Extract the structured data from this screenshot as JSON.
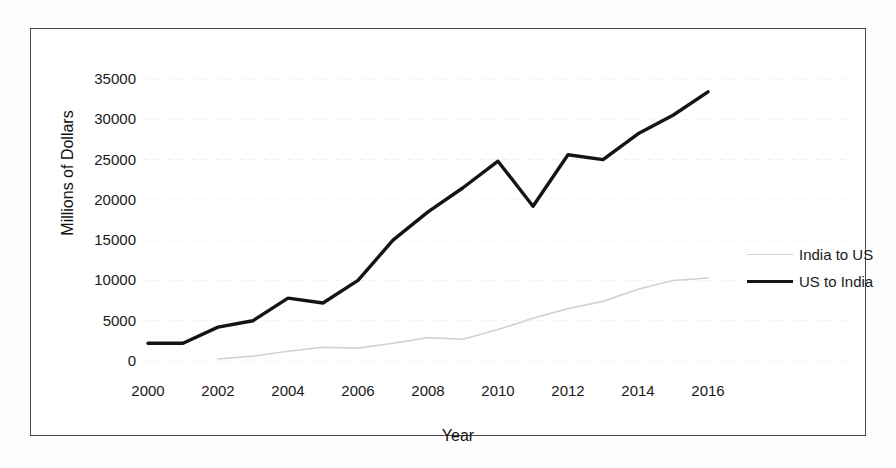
{
  "chart_data": {
    "type": "line",
    "title": "",
    "xlabel": "Year",
    "ylabel": "Millions of Dollars",
    "x": [
      2000,
      2001,
      2002,
      2003,
      2004,
      2005,
      2006,
      2007,
      2008,
      2009,
      2010,
      2011,
      2012,
      2013,
      2014,
      2015,
      2016
    ],
    "xticks": [
      "2000",
      "2002",
      "2004",
      "2006",
      "2008",
      "2010",
      "2012",
      "2014",
      "2016"
    ],
    "yticks": [
      "0",
      "5000",
      "10000",
      "15000",
      "20000",
      "25000",
      "30000",
      "35000"
    ],
    "xlim": [
      2000,
      2016
    ],
    "ylim": [
      0,
      35000
    ],
    "grid": false,
    "legend_position": "right",
    "series": [
      {
        "name": "India to US",
        "color": "#d2d2d2",
        "x": [
          2002,
          2003,
          2004,
          2005,
          2006,
          2007,
          2008,
          2009,
          2010,
          2011,
          2012,
          2013,
          2014,
          2015,
          2016
        ],
        "values": [
          250,
          600,
          1200,
          1700,
          1600,
          2200,
          2900,
          2700,
          3900,
          5300,
          6500,
          7400,
          8900,
          10000,
          10300
        ]
      },
      {
        "name": "US to India",
        "color": "#141414",
        "x": [
          2000,
          2001,
          2002,
          2003,
          2004,
          2005,
          2006,
          2007,
          2008,
          2009,
          2010,
          2011,
          2012,
          2013,
          2014,
          2015,
          2016
        ],
        "values": [
          2200,
          2200,
          4200,
          5000,
          7800,
          7200,
          10000,
          15000,
          18500,
          21500,
          24800,
          19200,
          25600,
          25000,
          28200,
          30500,
          33400
        ]
      }
    ]
  },
  "legend": {
    "items": [
      {
        "label": "India to US"
      },
      {
        "label": "US to India"
      }
    ]
  },
  "axes": {
    "xlabel": "Year",
    "ylabel": "Millions of Dollars"
  }
}
